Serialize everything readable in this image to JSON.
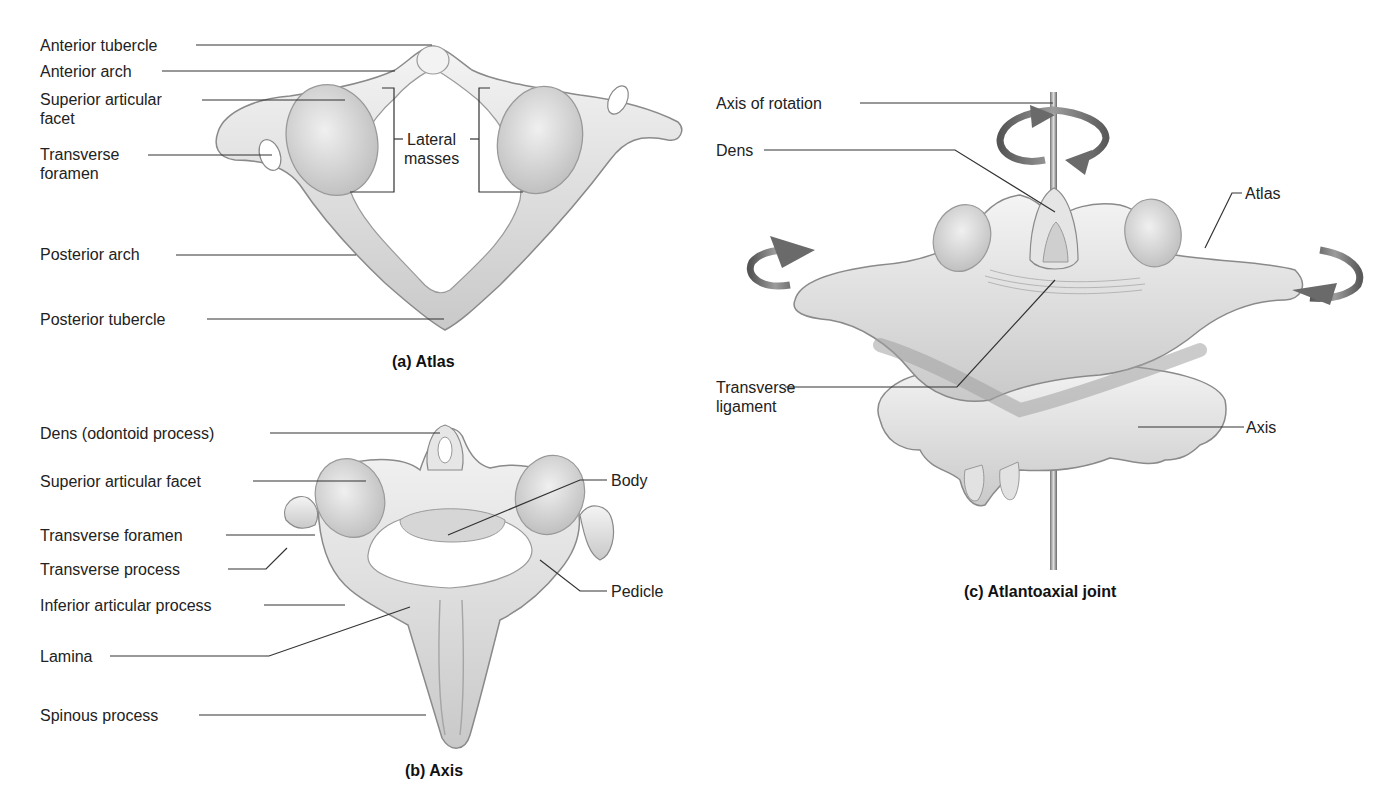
{
  "figure": {
    "panels": [
      {
        "id": "a",
        "caption": "(a) Atlas",
        "labels": {
          "anterior_tubercle": "Anterior tubercle",
          "anterior_arch": "Anterior arch",
          "superior_articular_facet": "Superior articular\nfacet",
          "transverse_foramen": "Transverse\nforamen",
          "lateral_masses": "Lateral\nmasses",
          "posterior_arch": "Posterior arch",
          "posterior_tubercle": "Posterior tubercle"
        }
      },
      {
        "id": "b",
        "caption": "(b) Axis",
        "labels": {
          "dens": "Dens (odontoid process)",
          "superior_articular_facet": "Superior articular facet",
          "transverse_foramen": "Transverse foramen",
          "transverse_process": "Transverse process",
          "inferior_articular_process": "Inferior articular process",
          "lamina": "Lamina",
          "spinous_process": "Spinous process",
          "body": "Body",
          "pedicle": "Pedicle"
        }
      },
      {
        "id": "c",
        "caption": "(c) Atlantoaxial joint",
        "labels": {
          "axis_of_rotation": "Axis of rotation",
          "dens": "Dens",
          "atlas": "Atlas",
          "transverse_ligament": "Transverse\nligament",
          "axis": "Axis"
        }
      }
    ],
    "colors": {
      "bone_light": "#efefef",
      "bone_mid": "#cfcfcf",
      "bone_dark": "#9a9a9a",
      "leader": "#333333",
      "arrow": "#6e6e6e"
    }
  }
}
